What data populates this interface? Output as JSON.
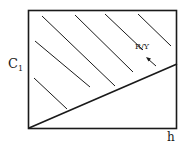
{
  "diagram": {
    "y_axis_label": "C",
    "y_axis_subscript": "1",
    "x_axis_label": "h",
    "region_label": "R/Y",
    "arrow_direction": "up-left",
    "frame": {
      "x": 28,
      "y": 10,
      "width": 149,
      "height": 119
    },
    "boundary_line": {
      "from": [
        29,
        128
      ],
      "to": [
        177,
        64
      ]
    },
    "hatch_lines": [
      {
        "from": [
          42,
          16
        ],
        "to": [
          115,
          86
        ]
      },
      {
        "from": [
          75,
          15
        ],
        "to": [
          133,
          72
        ]
      },
      {
        "from": [
          105,
          14
        ],
        "to": [
          143,
          50
        ]
      },
      {
        "from": [
          138,
          14
        ],
        "to": [
          171,
          46
        ]
      },
      {
        "from": [
          35,
          41
        ],
        "to": [
          90,
          87
        ]
      },
      {
        "from": [
          34,
          78
        ],
        "to": [
          67,
          109
        ]
      }
    ],
    "arrow": {
      "from": [
        156,
        66
      ],
      "to": [
        146,
        57
      ]
    },
    "colors": {
      "stroke": "#1a1a1a",
      "background": "#ffffff"
    }
  }
}
